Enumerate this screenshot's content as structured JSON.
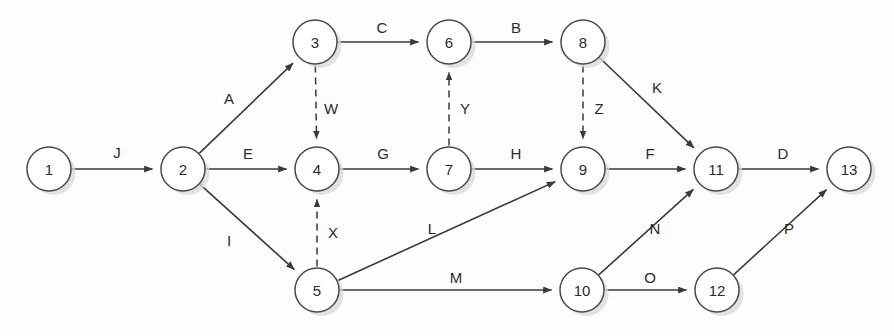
{
  "diagram": {
    "type": "directed-network",
    "width": 894,
    "height": 336,
    "node_radius": 22,
    "colors": {
      "background": "#fdfdfd",
      "node_fill": "#ffffff",
      "node_stroke": "#4a4a4a",
      "edge_stroke": "#3a3a3a",
      "text": "#2b2b2b",
      "shadow": "#d8d8d8"
    },
    "nodes": [
      {
        "id": "1",
        "label": "1",
        "x": 49,
        "y": 169
      },
      {
        "id": "2",
        "label": "2",
        "x": 183,
        "y": 169
      },
      {
        "id": "3",
        "label": "3",
        "x": 315,
        "y": 42
      },
      {
        "id": "4",
        "label": "4",
        "x": 317,
        "y": 169
      },
      {
        "id": "5",
        "label": "5",
        "x": 317,
        "y": 290
      },
      {
        "id": "6",
        "label": "6",
        "x": 449,
        "y": 42
      },
      {
        "id": "7",
        "label": "7",
        "x": 449,
        "y": 169
      },
      {
        "id": "8",
        "label": "8",
        "x": 583,
        "y": 42
      },
      {
        "id": "9",
        "label": "9",
        "x": 583,
        "y": 169
      },
      {
        "id": "10",
        "label": "10",
        "x": 582,
        "y": 290
      },
      {
        "id": "11",
        "label": "11",
        "x": 716,
        "y": 169
      },
      {
        "id": "12",
        "label": "12",
        "x": 717,
        "y": 290
      },
      {
        "id": "13",
        "label": "13",
        "x": 849,
        "y": 169
      }
    ],
    "edges": [
      {
        "label": "J",
        "from": "1",
        "to": "2",
        "style": "solid",
        "lx": 117,
        "ly": 152
      },
      {
        "label": "A",
        "from": "2",
        "to": "3",
        "style": "solid",
        "lx": 229,
        "ly": 98
      },
      {
        "label": "E",
        "from": "2",
        "to": "4",
        "style": "solid",
        "lx": 248,
        "ly": 153
      },
      {
        "label": "I",
        "from": "2",
        "to": "5",
        "style": "solid",
        "lx": 229,
        "ly": 240
      },
      {
        "label": "C",
        "from": "3",
        "to": "6",
        "style": "solid",
        "lx": 382,
        "ly": 27
      },
      {
        "label": "W",
        "from": "3",
        "to": "4",
        "style": "dashed",
        "lx": 331,
        "ly": 108
      },
      {
        "label": "G",
        "from": "4",
        "to": "7",
        "style": "solid",
        "lx": 383,
        "ly": 153
      },
      {
        "label": "B",
        "from": "6",
        "to": "8",
        "style": "solid",
        "lx": 516,
        "ly": 27
      },
      {
        "label": "Y",
        "from": "7",
        "to": "6",
        "style": "dashed",
        "lx": 465,
        "ly": 108
      },
      {
        "label": "H",
        "from": "7",
        "to": "9",
        "style": "solid",
        "lx": 516,
        "ly": 153
      },
      {
        "label": "X",
        "from": "5",
        "to": "4",
        "style": "dashed",
        "lx": 333,
        "ly": 232
      },
      {
        "label": "L",
        "from": "5",
        "to": "9",
        "style": "solid",
        "lx": 432,
        "ly": 228
      },
      {
        "label": "M",
        "from": "5",
        "to": "10",
        "style": "solid",
        "lx": 456,
        "ly": 277
      },
      {
        "label": "K",
        "from": "8",
        "to": "11",
        "style": "solid",
        "lx": 657,
        "ly": 87
      },
      {
        "label": "Z",
        "from": "8",
        "to": "9",
        "style": "dashed",
        "lx": 599,
        "ly": 108
      },
      {
        "label": "F",
        "from": "9",
        "to": "11",
        "style": "solid",
        "lx": 650,
        "ly": 153
      },
      {
        "label": "N",
        "from": "10",
        "to": "11",
        "style": "solid",
        "lx": 655,
        "ly": 228
      },
      {
        "label": "O",
        "from": "10",
        "to": "12",
        "style": "solid",
        "lx": 650,
        "ly": 277
      },
      {
        "label": "D",
        "from": "11",
        "to": "13",
        "style": "solid",
        "lx": 783,
        "ly": 153
      },
      {
        "label": "P",
        "from": "12",
        "to": "13",
        "style": "solid",
        "lx": 789,
        "ly": 228
      }
    ]
  }
}
